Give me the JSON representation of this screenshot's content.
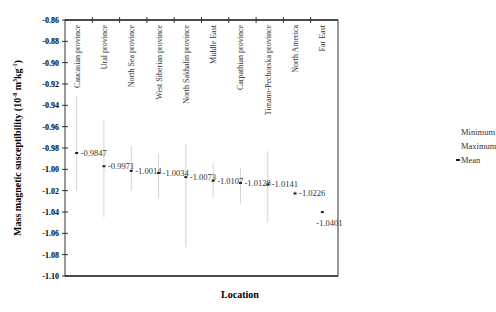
{
  "chart_data": {
    "type": "range-point",
    "title": "",
    "xlabel": "Location",
    "ylabel": "Mass magnetic susceptibility (10⁻⁸ m³kg⁻¹)",
    "ylim": [
      -1.1,
      -0.86
    ],
    "yticks": [
      -0.86,
      -0.88,
      -0.9,
      -0.92,
      -0.94,
      -0.96,
      -0.98,
      -1.0,
      -1.02,
      -1.04,
      -1.06,
      -1.08,
      -1.1
    ],
    "ytick_labels": [
      "-0.86",
      "-0.88",
      "-0.90",
      "-0.92",
      "-0.94",
      "-0.96",
      "-0.98",
      "-1.00",
      "-1.02",
      "-1.04",
      "-1.06",
      "-1.08",
      "-1.10"
    ],
    "categories": [
      "Caucasian province",
      "Ural province",
      "North Sea province",
      "West Siberian province",
      "North Sakhalin province",
      "Middle East",
      "Carpathian province",
      "Timano-Pechorska province",
      "North America",
      "Far East"
    ],
    "series": [
      {
        "name": "Mean",
        "values": [
          -0.9847,
          -0.9971,
          -1.0014,
          -1.0034,
          -1.0073,
          -1.0107,
          -1.0128,
          -1.0141,
          -1.0226,
          -1.0401
        ]
      },
      {
        "name": "Maximum",
        "values": [
          -0.931,
          -0.954,
          -0.978,
          -0.985,
          -0.976,
          -0.994,
          -0.999,
          -0.983,
          -1.02,
          -1.04
        ]
      },
      {
        "name": "Minimum",
        "values": [
          -1.02,
          -1.045,
          -1.02,
          -1.027,
          -1.073,
          -1.027,
          -1.032,
          -1.05,
          -1.026,
          -1.04
        ]
      }
    ],
    "data_labels": [
      "-0.9847",
      "-0.9971",
      "-1.0014",
      "-1.0034",
      "-1.0073",
      "-1.0107",
      "-1.0128",
      "-1.0141",
      "-1.0226",
      "-1.0401"
    ],
    "legend": {
      "position": "right",
      "entries": [
        "Minimum",
        "Maximum",
        "Mean"
      ]
    },
    "grid": false
  },
  "legend": {
    "minimum": "Minimum",
    "maximum": "Maximum",
    "mean": "Mean"
  },
  "axes": {
    "xlabel": "Location",
    "ylabel_main": "Mass magnetic susceptibility (10",
    "ylabel_exp1": "-8",
    "ylabel_mid": " m",
    "ylabel_exp2": "3",
    "ylabel_kg": "kg",
    "ylabel_exp3": "-1",
    "ylabel_end": ")"
  }
}
